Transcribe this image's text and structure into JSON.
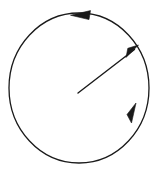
{
  "figure": {
    "background_color": "#ffffff",
    "stroke_color": "#1a1a1a",
    "width": 162,
    "height": 173
  },
  "chart_data": {
    "type": "diagram",
    "title": "",
    "xlabel": "",
    "ylabel": "",
    "grid": false,
    "legend": null,
    "annotations": [],
    "elements": [
      {
        "name": "circle",
        "shape": "ellipse",
        "center": [
          79,
          88
        ],
        "radius_x": 70,
        "radius_y": 75,
        "stroke": "#1a1a1a",
        "stroke_width": 1.3,
        "fill": "none"
      },
      {
        "name": "radius-vector",
        "shape": "arrow",
        "from": [
          78,
          93
        ],
        "to": [
          137,
          47
        ],
        "direction": "outward-up-right",
        "stroke": "#1a1a1a",
        "stroke_width": 1.4,
        "arrowhead": "filled-triangle"
      },
      {
        "name": "rotation-arrow-top",
        "shape": "arrowhead-on-arc",
        "position": [
          78,
          15
        ],
        "pointing": "left",
        "angle_deg": 186,
        "sense": "counterclockwise"
      },
      {
        "name": "rotation-arrow-lower-right",
        "shape": "arrowhead-on-arc",
        "position": [
          133,
          112
        ],
        "pointing": "up-right",
        "angle_deg": 292,
        "sense": "counterclockwise"
      }
    ],
    "rotation_sense": "counterclockwise",
    "arrow_count": 3
  }
}
